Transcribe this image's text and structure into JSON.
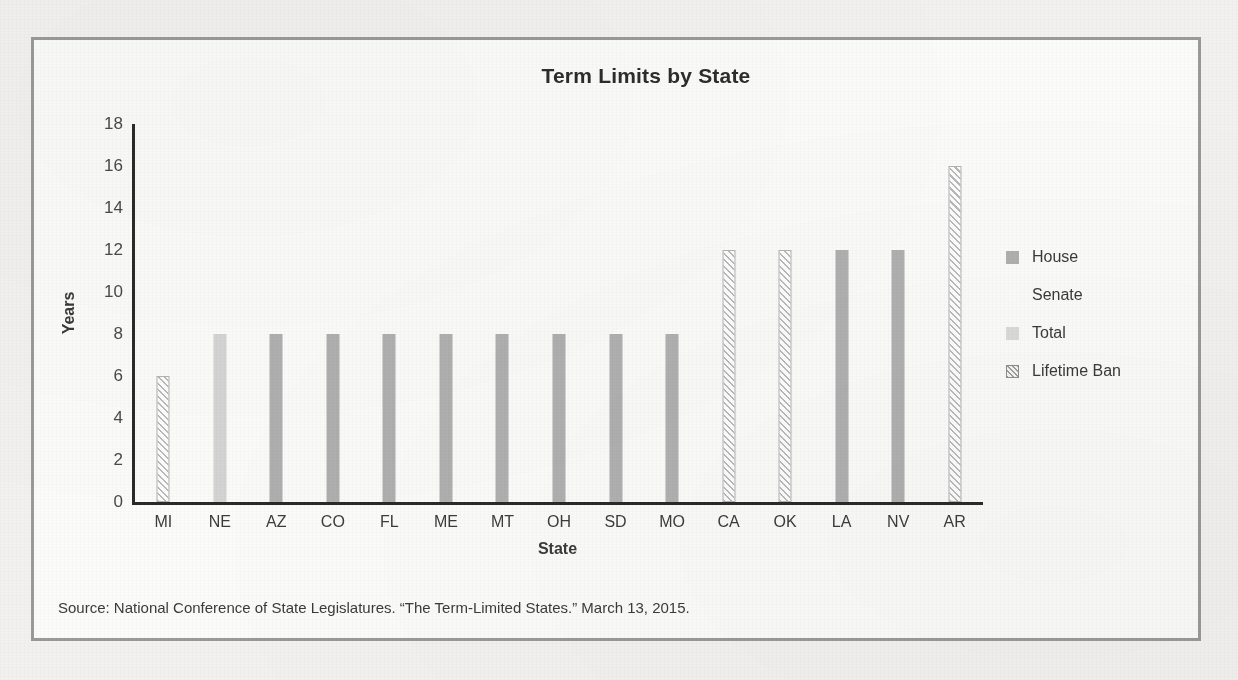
{
  "figure": {
    "title": "Term Limits by State",
    "source_note": "Source: National Conference of State Legislatures. “The Term-Limited States.” March 13, 2015.",
    "frame_color": "#9a9a9a",
    "background_color": "#fbfbfa"
  },
  "legend": {
    "position": "right",
    "entries": [
      {
        "label": "House",
        "series": "house",
        "color": "#b0b0b0",
        "pattern": "solid"
      },
      {
        "label": "Senate",
        "series": "senate",
        "color": "#fcfcfc",
        "pattern": "solid"
      },
      {
        "label": "Total",
        "series": "total",
        "color": "#dadada",
        "pattern": "solid"
      },
      {
        "label": "Lifetime Ban",
        "series": "lifetime",
        "color": "#9f9f9f",
        "pattern": "diagonal-hatch"
      }
    ]
  },
  "chart_data": {
    "type": "bar",
    "title": "Term Limits by State",
    "subtitle": "",
    "xlabel": "State",
    "ylabel": "Years",
    "ylim": [
      0,
      18
    ],
    "ytick_step": 2,
    "yticks": [
      18,
      16,
      14,
      12,
      10,
      8,
      6,
      4,
      2,
      0
    ],
    "grid": false,
    "legend_position": "right",
    "legend_entries": [
      "House",
      "Senate",
      "Total",
      "Lifetime Ban"
    ],
    "categories": [
      "MI",
      "NE",
      "AZ",
      "CO",
      "FL",
      "ME",
      "MT",
      "OH",
      "SD",
      "MO",
      "CA",
      "OK",
      "LA",
      "NV",
      "AR"
    ],
    "values": [
      6,
      8,
      8,
      8,
      8,
      8,
      8,
      8,
      8,
      8,
      12,
      12,
      12,
      12,
      16
    ],
    "bar_series": [
      "lifetime",
      "total",
      "house",
      "house",
      "house",
      "house",
      "house",
      "house",
      "house",
      "house",
      "lifetime",
      "lifetime",
      "house",
      "house",
      "lifetime"
    ],
    "points": [
      {
        "category": "MI",
        "value": 6,
        "series": "Lifetime Ban"
      },
      {
        "category": "NE",
        "value": 8,
        "series": "Total"
      },
      {
        "category": "AZ",
        "value": 8,
        "series": "House"
      },
      {
        "category": "CO",
        "value": 8,
        "series": "House"
      },
      {
        "category": "FL",
        "value": 8,
        "series": "House"
      },
      {
        "category": "ME",
        "value": 8,
        "series": "House"
      },
      {
        "category": "MT",
        "value": 8,
        "series": "House"
      },
      {
        "category": "OH",
        "value": 8,
        "series": "House"
      },
      {
        "category": "SD",
        "value": 8,
        "series": "House"
      },
      {
        "category": "MO",
        "value": 8,
        "series": "House"
      },
      {
        "category": "CA",
        "value": 12,
        "series": "Lifetime Ban"
      },
      {
        "category": "OK",
        "value": 12,
        "series": "Lifetime Ban"
      },
      {
        "category": "LA",
        "value": 12,
        "series": "House"
      },
      {
        "category": "NV",
        "value": 12,
        "series": "House"
      },
      {
        "category": "AR",
        "value": 16,
        "series": "Lifetime Ban"
      }
    ]
  }
}
